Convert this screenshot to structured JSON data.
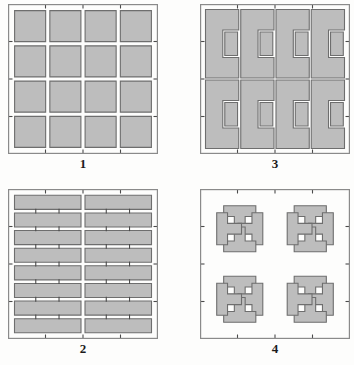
{
  "figure": {
    "panel_count": 4,
    "background_color": "#fdfdfc"
  },
  "style": {
    "tile_fill": "#bdbdbd",
    "tile_stroke": "#6e6e6e",
    "frame_stroke": "#8a8a8a",
    "gap_color": "#ffffff",
    "tick_color": "#4a4a4a",
    "label_color": "#1b1b1b",
    "tile_stroke_width": 1.1,
    "frame_stroke_width": 1.2,
    "tick_stroke_width": 1.1
  },
  "panels": [
    {
      "id": "panel-1",
      "label": "1",
      "pattern_name": "square-grid",
      "description": "Four by four grid of square paving tiles separated by uniform joints",
      "rows": 4,
      "cols": 4,
      "frame": {
        "x": 0,
        "y": 0,
        "w": 150,
        "h": 150
      },
      "tick_marks": {
        "top": 8,
        "bottom": 8,
        "left": 8,
        "right": 8
      }
    },
    {
      "id": "panel-2",
      "label": "2",
      "pattern_name": "running-bond-stretcher",
      "description": "Eight rows of two elongated stretcher bars laid in stacked bond",
      "rows": 8,
      "cols": 2,
      "frame": {
        "x": 0,
        "y": 0,
        "w": 150,
        "h": 150
      },
      "tick_marks": {
        "top": 8,
        "bottom": 8,
        "left": 8,
        "right": 8
      }
    },
    {
      "id": "panel-3",
      "label": "3",
      "pattern_name": "interlocking-zigzag-pavers",
      "description": "Interlocking Z and S shaped pavers arranged in four columns by two bands",
      "units_across": 4,
      "units_down": 2,
      "frame": {
        "x": 0,
        "y": 0,
        "w": 150,
        "h": 150
      },
      "tick_marks": {
        "top": 8,
        "bottom": 8,
        "left": 8,
        "right": 8
      }
    },
    {
      "id": "panel-4",
      "label": "4",
      "pattern_name": "interlocking-t-pavers-pinwheel",
      "description": "Interlocking T shaped pavers rotated in pinwheel groups of four, two by two quadrants",
      "units_across": 2,
      "units_down": 2,
      "frame": {
        "x": 0,
        "y": 0,
        "w": 150,
        "h": 150
      },
      "tick_marks": {
        "top": 8,
        "bottom": 8,
        "left": 8,
        "right": 8
      }
    }
  ]
}
